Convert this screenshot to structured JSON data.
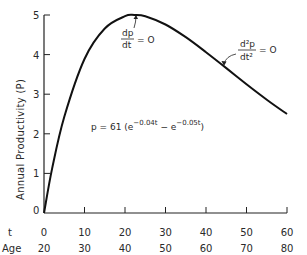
{
  "chart_data": {
    "type": "line",
    "title": "",
    "xlabel": "t",
    "xlabel_secondary": "Age",
    "ylabel": "Annual Productivity (P)",
    "xlim": [
      0,
      60
    ],
    "ylim": [
      0,
      5
    ],
    "grid": false,
    "x_ticks": [
      "0",
      "10",
      "20",
      "30",
      "40",
      "50",
      "60"
    ],
    "x_ticks_age": [
      "20",
      "30",
      "40",
      "50",
      "60",
      "70",
      "80"
    ],
    "y_ticks": [
      "0",
      "1",
      "2",
      "3",
      "4",
      "5"
    ],
    "series": [
      {
        "name": "p = 61(e^-0.04t - e^-0.05t)",
        "x": [
          0,
          2,
          5,
          10,
          15,
          20,
          22.3,
          25,
          30,
          35,
          40,
          45,
          50,
          55,
          60
        ],
        "values": [
          0,
          1.12,
          2.43,
          3.89,
          4.66,
          4.97,
          5.0,
          4.97,
          4.76,
          4.44,
          4.06,
          3.66,
          3.25,
          2.86,
          2.5
        ]
      }
    ],
    "annotations": [
      {
        "text": "dp/dt = 0",
        "at_x": 22.3,
        "at_y": 5.0
      },
      {
        "text": "d²p/dt² = 0",
        "at_x": 44.6,
        "at_y": 3.7
      },
      {
        "text": "p = 61(e^-0.04t - e^-0.05t)",
        "position": "center"
      }
    ]
  },
  "labels": {
    "axis_t": "t",
    "axis_age": "Age",
    "ylabel": "Annual Productivity (P)",
    "ann1_num": "dp",
    "ann1_den": "dt",
    "ann1_rhs": "= O",
    "ann2_num": "d²p",
    "ann2_den": "dt²",
    "ann2_rhs": "= O",
    "formula_lhs": "p = 61 (e",
    "formula_exp1": "−0.04t",
    "formula_mid": " − e",
    "formula_exp2": "−0.05t",
    "formula_rhs": ")"
  }
}
